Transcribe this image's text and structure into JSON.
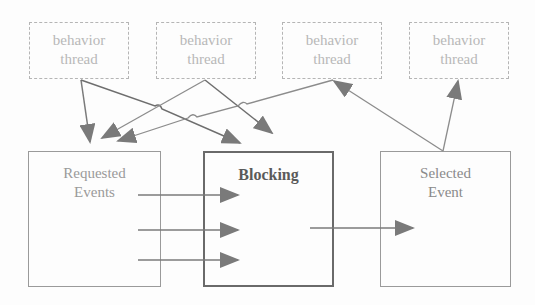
{
  "diagram": {
    "threads": [
      {
        "line1": "behavior",
        "line2": "thread"
      },
      {
        "line1": "behavior",
        "line2": "thread"
      },
      {
        "line1": "behavior",
        "line2": "thread"
      },
      {
        "line1": "behavior",
        "line2": "thread"
      }
    ],
    "requested": {
      "line1": "Requested",
      "line2": "Events"
    },
    "blocking": {
      "label": "Blocking"
    },
    "selected": {
      "line1": "Selected",
      "line2": "Event"
    },
    "colors": {
      "thread_border": "#b5b5b5",
      "thread_text": "#b8b8b8",
      "arrow_dark": "#6e6e6e",
      "arrow_light": "#8c8c8c",
      "box_border": "#9a9a9a",
      "blocking_border": "#6a6a6a"
    },
    "edges": [
      {
        "from": "thread-1",
        "to": "requested-events"
      },
      {
        "from": "thread-1",
        "to": "blocking"
      },
      {
        "from": "thread-2",
        "to": "requested-events"
      },
      {
        "from": "thread-2",
        "to": "blocking"
      },
      {
        "from": "thread-3",
        "to": "requested-events"
      },
      {
        "from": "requested-events",
        "to": "blocking",
        "count": 3
      },
      {
        "from": "blocking",
        "to": "selected-event"
      },
      {
        "from": "selected-event",
        "to": "thread-3"
      },
      {
        "from": "selected-event",
        "to": "thread-4"
      }
    ]
  }
}
